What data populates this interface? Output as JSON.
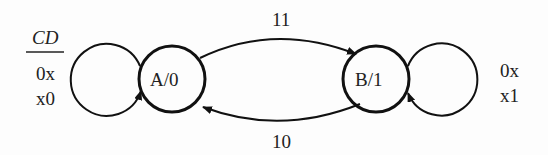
{
  "diagram": {
    "type": "moore-state-machine",
    "input_header": "CD",
    "states": [
      {
        "id": "A",
        "label": "A/0",
        "output": "0"
      },
      {
        "id": "B",
        "label": "B/1",
        "output": "1"
      }
    ],
    "transitions": [
      {
        "from": "A",
        "to": "A",
        "labels": [
          "0x",
          "x0"
        ]
      },
      {
        "from": "A",
        "to": "B",
        "label": "11"
      },
      {
        "from": "B",
        "to": "A",
        "label": "10"
      },
      {
        "from": "B",
        "to": "B",
        "labels": [
          "0x",
          "x1"
        ]
      }
    ]
  }
}
